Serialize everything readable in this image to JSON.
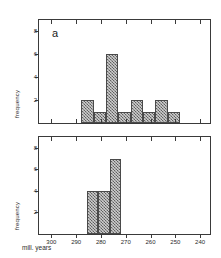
{
  "figure": {
    "xlabel": "mill. years",
    "x_axis_ticks": [
      "300",
      "290",
      "280",
      "270",
      "260",
      "250",
      "240"
    ],
    "y_axis_ticks": [
      "2",
      "4",
      "6",
      "8"
    ]
  },
  "panels": [
    {
      "letter": "a",
      "ylabel": "frequency"
    },
    {
      "letter": "b",
      "ylabel": "frequency"
    }
  ],
  "chart_data": [
    {
      "type": "bar",
      "title": "a",
      "xlabel": "mill. years",
      "ylabel": "frequency",
      "xlim": [
        305,
        236
      ],
      "ylim": [
        0,
        9
      ],
      "x_reversed": true,
      "grid": false,
      "legend": "none",
      "bin_width": 5,
      "bin_starts": [
        288,
        283,
        278,
        273,
        268,
        263,
        258,
        253
      ],
      "bin_ends": [
        283,
        278,
        273,
        268,
        263,
        258,
        253,
        248
      ],
      "categories": [
        "288-283",
        "283-278",
        "278-273",
        "273-268",
        "268-263",
        "263-258",
        "258-253",
        "253-248"
      ],
      "values": [
        2,
        1,
        6,
        1,
        2,
        1,
        2,
        1
      ]
    },
    {
      "type": "bar",
      "title": "b",
      "xlabel": "mill. years",
      "ylabel": "frequency",
      "xlim": [
        305,
        236
      ],
      "ylim": [
        0,
        9
      ],
      "x_reversed": true,
      "grid": false,
      "legend": "none",
      "bin_width": 4.5,
      "bin_starts": [
        285.5,
        281,
        276.5
      ],
      "bin_ends": [
        281,
        276.5,
        272
      ],
      "categories": [
        "285.5-281",
        "281-276.5",
        "276.5-272"
      ],
      "values": [
        4,
        4,
        7
      ]
    }
  ]
}
